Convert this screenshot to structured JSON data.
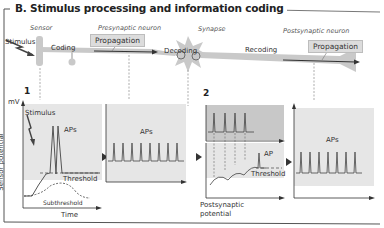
{
  "title": "B. Stimulus processing and information coding",
  "top_row": {
    "sensor_label": "Sensor",
    "presynaptic_label": "Presynaptic neuron",
    "synapse_label": "Synapse",
    "postsynaptic_label": "Postsynaptic neuron",
    "stimulus_label": "Stimulus",
    "coding_label": "Coding",
    "decoding_label": "Decoding",
    "recoding_label": "Recoding",
    "propagation_1": "Propagation",
    "propagation_2": "Propagation"
  },
  "panels": {
    "panel1": {
      "number": "1",
      "y_unit": "mV",
      "stimulus": "Stimulus",
      "aps": "APs",
      "threshold": "Threshold",
      "subthreshold": "Subthreshold",
      "xlabel": "Time",
      "ylabel": "Sensor potential"
    },
    "panel2": {
      "aps": "APs"
    },
    "panel3": {
      "number": "2",
      "ap": "AP",
      "threshold": "Threshold",
      "xlabel_line1": "Postsynaptic",
      "xlabel_line2": "potential"
    },
    "panel4": {
      "aps": "APs"
    }
  },
  "colors": {
    "panel_bg": "#e8e8e8",
    "panel_dark_bg": "#c8c8c8",
    "neuron_fill": "#c9c9c9",
    "trace": "#444444",
    "arrow_dark": "#333333"
  }
}
